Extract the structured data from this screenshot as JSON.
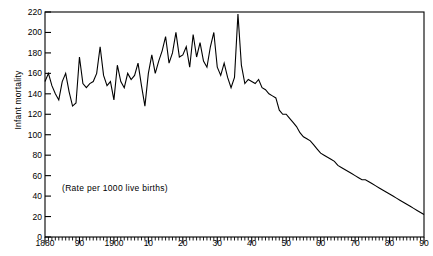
{
  "chart_data": {
    "type": "line",
    "title": "",
    "subtitle": "",
    "annotation": "(Rate per 1000 live births)",
    "xlabel": "",
    "ylabel": "Infant mortality",
    "xlim": [
      1880,
      1990
    ],
    "ylim": [
      0,
      220
    ],
    "grid": false,
    "legend": null,
    "y_ticks": [
      0,
      20,
      40,
      60,
      80,
      100,
      120,
      140,
      160,
      180,
      200,
      220
    ],
    "y_tick_labels": [
      "0",
      "20",
      "40",
      "60",
      "80",
      "100",
      "120",
      "140",
      "160",
      "180",
      "200",
      "220"
    ],
    "y_major_step": 20,
    "x_ticks": [
      1880,
      1890,
      1900,
      1910,
      1920,
      1930,
      1940,
      1950,
      1960,
      1970,
      1980,
      1990
    ],
    "x_tick_labels": [
      "1880",
      "90",
      "1900",
      "10",
      "20",
      "30",
      "40",
      "50",
      "60",
      "70",
      "80",
      "90"
    ],
    "x_minor_step": 1,
    "series": [
      {
        "name": "Infant mortality rate",
        "color": "#000000",
        "x": [
          1880,
          1881,
          1882,
          1883,
          1884,
          1885,
          1886,
          1887,
          1888,
          1889,
          1890,
          1891,
          1892,
          1893,
          1894,
          1895,
          1896,
          1897,
          1898,
          1899,
          1900,
          1901,
          1902,
          1903,
          1904,
          1905,
          1906,
          1907,
          1908,
          1909,
          1910,
          1911,
          1912,
          1913,
          1914,
          1915,
          1916,
          1917,
          1918,
          1919,
          1920,
          1921,
          1922,
          1923,
          1924,
          1925,
          1926,
          1927,
          1928,
          1929,
          1930,
          1931,
          1932,
          1933,
          1934,
          1935,
          1936,
          1937,
          1938,
          1939,
          1940,
          1941,
          1942,
          1943,
          1944,
          1945,
          1946,
          1947,
          1948,
          1949,
          1950,
          1951,
          1952,
          1953,
          1954,
          1955,
          1956,
          1957,
          1958,
          1959,
          1960,
          1961,
          1962,
          1963,
          1964,
          1965,
          1966,
          1967,
          1968,
          1969,
          1970,
          1971,
          1972,
          1973,
          1974,
          1975,
          1976,
          1977,
          1978,
          1979,
          1980,
          1981,
          1982,
          1983,
          1984,
          1985,
          1986,
          1987,
          1988,
          1989,
          1990
        ],
        "values": [
          152,
          160,
          148,
          140,
          134,
          152,
          160,
          142,
          128,
          131,
          176,
          150,
          146,
          150,
          152,
          160,
          186,
          158,
          148,
          152,
          134,
          168,
          152,
          146,
          160,
          154,
          158,
          170,
          148,
          128,
          160,
          178,
          160,
          172,
          182,
          196,
          170,
          180,
          200,
          176,
          178,
          186,
          166,
          198,
          176,
          190,
          172,
          166,
          186,
          200,
          166,
          158,
          170,
          156,
          146,
          156,
          218,
          168,
          150,
          154,
          152,
          150,
          154,
          146,
          144,
          140,
          138,
          136,
          124,
          120,
          120,
          116,
          112,
          108,
          102,
          98,
          96,
          94,
          90,
          86,
          82,
          80,
          78,
          76,
          74,
          70,
          68,
          66,
          64,
          62,
          60,
          58,
          56,
          56,
          54,
          52,
          50,
          48,
          46,
          44,
          42,
          40,
          38,
          36,
          34,
          32,
          30,
          28,
          26,
          24,
          22
        ]
      }
    ]
  },
  "axis": {
    "ylabel_text": "Infant mortality"
  }
}
